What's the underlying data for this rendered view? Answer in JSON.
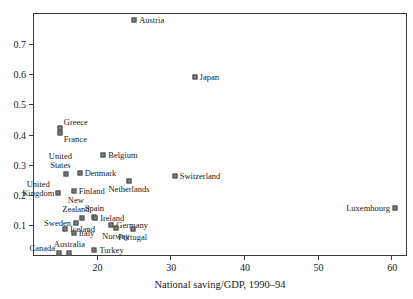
{
  "chart_data": {
    "type": "scatter",
    "title": "",
    "xlabel": "National saving/GDP, 1990–94",
    "ylabel": "",
    "xlim": [
      11.5,
      62.0
    ],
    "ylim": [
      0.0,
      0.8
    ],
    "xticks": [
      20,
      30,
      40,
      50,
      60
    ],
    "xtick_labels": [
      "20",
      "30",
      "40",
      "50",
      "60"
    ],
    "yticks": [
      0.1,
      0.2,
      0.3,
      0.4,
      0.5,
      0.6,
      0.7
    ],
    "ytick_labels": [
      "0.1",
      "0.2",
      "0.3",
      "0.4",
      "0.5",
      "0.6",
      "0.7"
    ],
    "grid": false,
    "legend": "none",
    "marker_shape": "square",
    "marker_color": "#808080",
    "marker_edge_color": "#4a4a4a",
    "points": [
      {
        "name": "Austria",
        "x": 25.1,
        "y": 0.78,
        "label_pos": "right"
      },
      {
        "name": "Japan",
        "x": 33.3,
        "y": 0.59,
        "label_pos": "right"
      },
      {
        "name": "Greece",
        "x": 15.0,
        "y": 0.422,
        "label_pos": "right-above"
      },
      {
        "name": "France",
        "x": 15.0,
        "y": 0.405,
        "label_pos": "right-below"
      },
      {
        "name": "Belgium",
        "x": 20.9,
        "y": 0.332,
        "label_pos": "right"
      },
      {
        "name": "United States",
        "x": 15.9,
        "y": 0.268,
        "label_pos": "above-left"
      },
      {
        "name": "Denmark",
        "x": 17.7,
        "y": 0.272,
        "label_pos": "right"
      },
      {
        "name": "Switzerland",
        "x": 30.6,
        "y": 0.263,
        "label_pos": "right"
      },
      {
        "name": "Netherlands",
        "x": 24.4,
        "y": 0.247,
        "label_pos": "below"
      },
      {
        "name": "United Kingdom",
        "x": 14.8,
        "y": 0.207,
        "label_pos": "left-above"
      },
      {
        "name": "Finland",
        "x": 16.9,
        "y": 0.212,
        "label_pos": "right"
      },
      {
        "name": "Luxembourg",
        "x": 60.5,
        "y": 0.157,
        "label_pos": "left"
      },
      {
        "name": "Spain",
        "x": 19.7,
        "y": 0.127,
        "label_pos": "above"
      },
      {
        "name": "New Zealand",
        "x": 18.0,
        "y": 0.122,
        "label_pos": "above-left"
      },
      {
        "name": "Ireland",
        "x": 19.8,
        "y": 0.122,
        "label_pos": "right"
      },
      {
        "name": "Sweden",
        "x": 17.2,
        "y": 0.105,
        "label_pos": "left"
      },
      {
        "name": "Germany",
        "x": 22.0,
        "y": 0.1,
        "label_pos": "right"
      },
      {
        "name": "Iceland",
        "x": 15.7,
        "y": 0.085,
        "label_pos": "right"
      },
      {
        "name": "Norway",
        "x": 22.6,
        "y": 0.089,
        "label_pos": "below"
      },
      {
        "name": "Portugal",
        "x": 24.9,
        "y": 0.086,
        "label_pos": "below"
      },
      {
        "name": "Italy",
        "x": 16.9,
        "y": 0.072,
        "label_pos": "right"
      },
      {
        "name": "Canada",
        "x": 14.9,
        "y": 0.008,
        "label_pos": "left-above"
      },
      {
        "name": "Australia",
        "x": 16.3,
        "y": 0.008,
        "label_pos": "above"
      },
      {
        "name": "Turkey",
        "x": 19.7,
        "y": 0.015,
        "label_pos": "right"
      }
    ]
  }
}
